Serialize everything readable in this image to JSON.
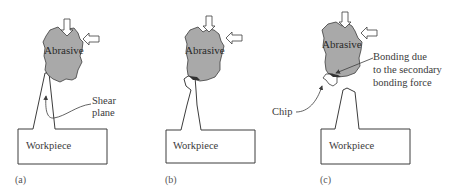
{
  "figure": {
    "panels": [
      {
        "id": "a",
        "caption": "(a)",
        "abrasive_label": "Abrasive",
        "workpiece_label": "Workpiece",
        "annotation": {
          "line1": "Shear",
          "line2": "plane"
        }
      },
      {
        "id": "b",
        "caption": "(b)",
        "abrasive_label": "Abrasive",
        "workpiece_label": "Workpiece"
      },
      {
        "id": "c",
        "caption": "(c)",
        "abrasive_label": "Abrasive",
        "workpiece_label": "Workpiece",
        "chip_label": "Chip",
        "annotation": {
          "line1": "Bonding due",
          "line2": "to the secondary",
          "line3": "bonding force"
        }
      }
    ],
    "colors": {
      "abrasive_fill": "#a9a9a9",
      "stroke": "#3c3c3c",
      "background": "#ffffff",
      "contact_zone": "#333333"
    },
    "forces": [
      "downward-force-arrow",
      "leftward-force-arrow"
    ]
  }
}
